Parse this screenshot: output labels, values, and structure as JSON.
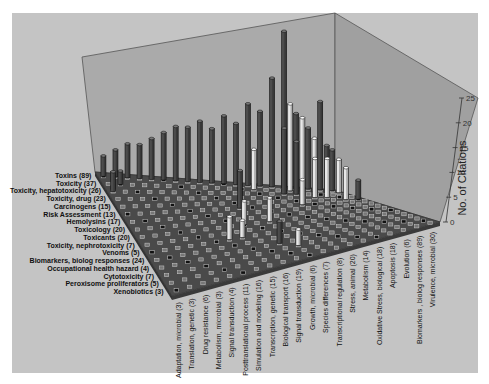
{
  "chart_data": {
    "type": "bar",
    "subtype": "3d-bar-matrix",
    "title": "",
    "zlabel": "No. of Citations",
    "zlim": [
      0,
      25
    ],
    "z_ticks": [
      0,
      5,
      10,
      15,
      20,
      25
    ],
    "y_categories": [
      "Toxins (89)",
      "Toxicity (37)",
      "Toxicity, hepatotoxicity (26)",
      "Toxicity, drug (23)",
      "Carcinogens (15)",
      "Risk Assessment (13)",
      "Hemolysins (17)",
      "Toxicology (20)",
      "Toxicants (20)",
      "Toxicity, nephrotoxicity (7)",
      "Venoms (5)",
      "Biomarkers, biolog responses (24)",
      "Occupational health hazard (4)",
      "Cytotoxicity (7)",
      "Peroxisome proliferators (5)",
      "Xenobiotics (3)"
    ],
    "x_categories": [
      "Adaptation, microbial (3)",
      "Translation, genetic (3)",
      "Drug resistance (6)",
      "Metabolism, microbial (3)",
      "Signal transduction (4)",
      "Posttranslational process (11)",
      "Simulation and modeling (16)",
      "Transcription, genetic (15)",
      "Biological transport (16)",
      "Signal transduction (19)",
      "Growth, microbial (6)",
      "Species differences (7)",
      "Transcriptional regulation (8)",
      "Stress, animal (20)",
      "Metabolism (14)",
      "Oxidative Stress, biological (18)",
      "Apoptosis (18)",
      "Evolution (6)",
      "Biomarkers , biolog responses (89)",
      "Virulence, microbial (30)"
    ],
    "bars": [
      {
        "x": 0,
        "y": 0,
        "z": 3
      },
      {
        "x": 1,
        "y": 0,
        "z": 4
      },
      {
        "x": 2,
        "y": 0,
        "z": 5
      },
      {
        "x": 3,
        "y": 0,
        "z": 5
      },
      {
        "x": 4,
        "y": 0,
        "z": 6
      },
      {
        "x": 5,
        "y": 0,
        "z": 7
      },
      {
        "x": 6,
        "y": 0,
        "z": 8
      },
      {
        "x": 7,
        "y": 0,
        "z": 8
      },
      {
        "x": 8,
        "y": 0,
        "z": 9
      },
      {
        "x": 9,
        "y": 0,
        "z": 8
      },
      {
        "x": 10,
        "y": 0,
        "z": 10
      },
      {
        "x": 11,
        "y": 0,
        "z": 9
      },
      {
        "x": 12,
        "y": 0,
        "z": 12
      },
      {
        "x": 13,
        "y": 0,
        "z": 11
      },
      {
        "x": 14,
        "y": 0,
        "z": 16
      },
      {
        "x": 15,
        "y": 0,
        "z": 23
      },
      {
        "x": 16,
        "y": 0,
        "z": 11
      },
      {
        "x": 17,
        "y": 0,
        "z": 9
      },
      {
        "x": 18,
        "y": 0,
        "z": 13
      },
      {
        "x": 19,
        "y": 0,
        "z": 6
      },
      {
        "x": 15,
        "y": 1,
        "z": 13,
        "light": true
      },
      {
        "x": 16,
        "y": 1,
        "z": 11,
        "light": true
      },
      {
        "x": 12,
        "y": 1,
        "z": 6,
        "light": true
      },
      {
        "x": 17,
        "y": 1,
        "z": 8,
        "light": true
      },
      {
        "x": 18,
        "y": 1,
        "z": 7
      },
      {
        "x": 19,
        "y": 1,
        "z": 5,
        "light": true
      },
      {
        "x": 14,
        "y": 2,
        "z": 10
      },
      {
        "x": 15,
        "y": 2,
        "z": 8
      },
      {
        "x": 16,
        "y": 3,
        "z": 6,
        "light": true
      },
      {
        "x": 17,
        "y": 3,
        "z": 6,
        "light": true
      },
      {
        "x": 18,
        "y": 4,
        "z": 5,
        "light": true
      },
      {
        "x": 19,
        "y": 4,
        "z": 3
      },
      {
        "x": 9,
        "y": 5,
        "z": 6
      },
      {
        "x": 14,
        "y": 5,
        "z": 4,
        "light": true
      },
      {
        "x": 8,
        "y": 8,
        "z": 4,
        "light": true
      },
      {
        "x": 10,
        "y": 8,
        "z": 4,
        "light": true
      },
      {
        "x": 6,
        "y": 10,
        "z": 4,
        "light": true
      },
      {
        "x": 7,
        "y": 10,
        "z": 3,
        "light": true
      },
      {
        "x": 9,
        "y": 12,
        "z": 4
      },
      {
        "x": 10,
        "y": 13,
        "z": 3,
        "light": true
      },
      {
        "x": 0,
        "y": 2,
        "z": 3
      },
      {
        "x": 1,
        "y": 1,
        "z": 2
      }
    ],
    "grid": true,
    "legend": null
  },
  "axis": {
    "zlabel": "No. of Citations",
    "ticks": [
      "0",
      "5",
      "10",
      "15",
      "20",
      "25"
    ]
  },
  "colors": {
    "page_bg": "#ffffff",
    "panel_bg": "#c4c4c4",
    "wall": "#aaaaaa",
    "floor": "#4a4a4a",
    "bar_dark": "#4c4c4c",
    "bar_light": "#e8e8e8",
    "text": "#111111"
  }
}
